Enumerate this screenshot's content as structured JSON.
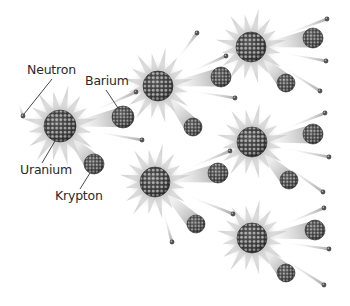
{
  "diagram": {
    "type": "nuclear-fission-chain-reaction",
    "colors": {
      "background": "#ffffff",
      "nucleus_dark": "#3a3a3a",
      "nucleon": "#9a9a9a",
      "flare": "#c8c8c8",
      "trail": "#b0b0b0",
      "neutron": "#555555",
      "label_text": "#2a2a2a",
      "leader_line": "#333333"
    },
    "labels": [
      {
        "id": "neutron",
        "text": "Neutron",
        "x": 27,
        "y": 64,
        "line": [
          [
            52,
            79
          ],
          [
            24,
            114
          ]
        ]
      },
      {
        "id": "barium",
        "text": "Barium",
        "x": 85,
        "y": 75,
        "line": [
          [
            106,
            90
          ],
          [
            118,
            108
          ]
        ]
      },
      {
        "id": "uranium",
        "text": "Uranium",
        "x": 20,
        "y": 164,
        "line": [
          [
            42,
            163
          ],
          [
            55,
            141
          ]
        ]
      },
      {
        "id": "krypton",
        "text": "Krypton",
        "x": 55,
        "y": 190,
        "line": [
          [
            80,
            189
          ],
          [
            90,
            173
          ]
        ]
      }
    ],
    "nuclei": [
      {
        "id": "uranium-1",
        "cx": 60,
        "cy": 126,
        "r": 16
      },
      {
        "id": "uranium-2",
        "cx": 158,
        "cy": 86,
        "r": 15
      },
      {
        "id": "uranium-3",
        "cx": 155,
        "cy": 182,
        "r": 15
      },
      {
        "id": "uranium-4",
        "cx": 251,
        "cy": 47,
        "r": 15
      },
      {
        "id": "uranium-5",
        "cx": 252,
        "cy": 142,
        "r": 15
      },
      {
        "id": "uranium-6",
        "cx": 252,
        "cy": 238,
        "r": 15
      }
    ],
    "fragments": [
      {
        "id": "barium-1",
        "from": [
          60,
          126
        ],
        "cx": 123,
        "cy": 117,
        "r": 11
      },
      {
        "id": "krypton-1",
        "from": [
          60,
          126
        ],
        "cx": 94,
        "cy": 164,
        "r": 10
      },
      {
        "id": "barium-2",
        "from": [
          158,
          86
        ],
        "cx": 221,
        "cy": 77,
        "r": 10
      },
      {
        "id": "krypton-2",
        "from": [
          158,
          86
        ],
        "cx": 193,
        "cy": 127,
        "r": 9
      },
      {
        "id": "barium-3",
        "from": [
          155,
          182
        ],
        "cx": 218,
        "cy": 173,
        "r": 10
      },
      {
        "id": "krypton-3",
        "from": [
          155,
          182
        ],
        "cx": 196,
        "cy": 224,
        "r": 9
      },
      {
        "id": "barium-4",
        "from": [
          251,
          47
        ],
        "cx": 313,
        "cy": 38,
        "r": 10
      },
      {
        "id": "krypton-4",
        "from": [
          251,
          47
        ],
        "cx": 286,
        "cy": 83,
        "r": 9
      },
      {
        "id": "barium-5",
        "from": [
          252,
          142
        ],
        "cx": 313,
        "cy": 134,
        "r": 10
      },
      {
        "id": "krypton-5",
        "from": [
          252,
          142
        ],
        "cx": 289,
        "cy": 180,
        "r": 9
      },
      {
        "id": "barium-6",
        "from": [
          252,
          238
        ],
        "cx": 315,
        "cy": 230,
        "r": 10
      },
      {
        "id": "krypton-6",
        "from": [
          252,
          238
        ],
        "cx": 286,
        "cy": 273,
        "r": 9
      }
    ],
    "neutrons": [
      {
        "from": [
          14,
          90
        ],
        "x": 23,
        "y": 116
      },
      {
        "from": [
          60,
          126
        ],
        "x": 136,
        "y": 92
      },
      {
        "from": [
          60,
          126
        ],
        "x": 142,
        "y": 140
      },
      {
        "from": [
          158,
          86
        ],
        "x": 197,
        "y": 33
      },
      {
        "from": [
          158,
          86
        ],
        "x": 226,
        "y": 56
      },
      {
        "from": [
          158,
          86
        ],
        "x": 235,
        "y": 98
      },
      {
        "from": [
          155,
          182
        ],
        "x": 230,
        "y": 151
      },
      {
        "from": [
          155,
          182
        ],
        "x": 233,
        "y": 214
      },
      {
        "from": [
          155,
          182
        ],
        "x": 172,
        "y": 242
      },
      {
        "from": [
          251,
          47
        ],
        "x": 327,
        "y": 19
      },
      {
        "from": [
          251,
          47
        ],
        "x": 326,
        "y": 61
      },
      {
        "from": [
          251,
          47
        ],
        "x": 320,
        "y": 91
      },
      {
        "from": [
          252,
          142
        ],
        "x": 325,
        "y": 113
      },
      {
        "from": [
          252,
          142
        ],
        "x": 329,
        "y": 157
      },
      {
        "from": [
          252,
          142
        ],
        "x": 323,
        "y": 192
      },
      {
        "from": [
          252,
          238
        ],
        "x": 324,
        "y": 208
      },
      {
        "from": [
          252,
          238
        ],
        "x": 329,
        "y": 249
      },
      {
        "from": [
          252,
          238
        ],
        "x": 324,
        "y": 285
      }
    ]
  }
}
